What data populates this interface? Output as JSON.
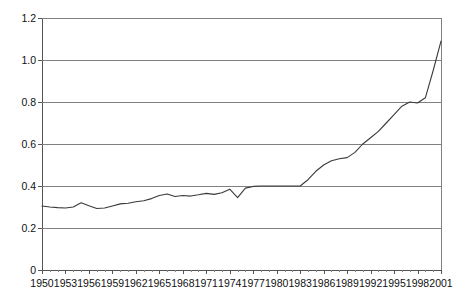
{
  "chart_data": {
    "type": "line",
    "title": "",
    "subtitle": "",
    "xlabel": "",
    "ylabel": "",
    "xlim": [
      1950,
      2001
    ],
    "ylim": [
      0,
      1.2
    ],
    "grid": true,
    "legend": false,
    "legend_position": "none",
    "y_ticks": [
      "0",
      "0.2",
      "0.4",
      "0.6",
      "0.8",
      "1.0",
      "1.2"
    ],
    "y_tick_values": [
      0,
      0.2,
      0.4,
      0.6,
      0.8,
      1.0,
      1.2
    ],
    "x_ticks": [
      "1950",
      "1953",
      "1956",
      "1959",
      "1962",
      "1965",
      "1968",
      "1971",
      "1974",
      "1977",
      "1980",
      "1983",
      "1986",
      "1989",
      "1992",
      "1995",
      "1998",
      "2001"
    ],
    "x_tick_values": [
      1950,
      1953,
      1956,
      1959,
      1962,
      1965,
      1968,
      1971,
      1974,
      1977,
      1980,
      1983,
      1986,
      1989,
      1992,
      1995,
      1998,
      2001
    ],
    "x": [
      1950,
      1951,
      1952,
      1953,
      1954,
      1955,
      1956,
      1957,
      1958,
      1959,
      1960,
      1961,
      1962,
      1963,
      1964,
      1965,
      1966,
      1967,
      1968,
      1969,
      1970,
      1971,
      1972,
      1973,
      1974,
      1975,
      1976,
      1977,
      1978,
      1979,
      1980,
      1981,
      1982,
      1983,
      1984,
      1985,
      1986,
      1987,
      1988,
      1989,
      1990,
      1991,
      1992,
      1993,
      1994,
      1995,
      1996,
      1997,
      1998,
      1999,
      2000,
      2001
    ],
    "values": [
      0.305,
      0.3,
      0.297,
      0.295,
      0.3,
      0.32,
      0.306,
      0.293,
      0.295,
      0.305,
      0.315,
      0.318,
      0.325,
      0.33,
      0.34,
      0.355,
      0.362,
      0.35,
      0.355,
      0.352,
      0.358,
      0.365,
      0.36,
      0.368,
      0.385,
      0.345,
      0.39,
      0.398,
      0.4,
      0.4,
      0.4,
      0.4,
      0.4,
      0.4,
      0.43,
      0.47,
      0.5,
      0.52,
      0.53,
      0.535,
      0.56,
      0.6,
      0.63,
      0.66,
      0.7,
      0.74,
      0.78,
      0.8,
      0.795,
      0.82,
      0.95,
      1.09
    ],
    "series": [
      {
        "name": "series-1",
        "color": "#3a3a3a",
        "values": [
          0.305,
          0.3,
          0.297,
          0.295,
          0.3,
          0.32,
          0.306,
          0.293,
          0.295,
          0.305,
          0.315,
          0.318,
          0.325,
          0.33,
          0.34,
          0.355,
          0.362,
          0.35,
          0.355,
          0.352,
          0.358,
          0.365,
          0.36,
          0.368,
          0.385,
          0.345,
          0.39,
          0.398,
          0.4,
          0.4,
          0.4,
          0.4,
          0.4,
          0.4,
          0.43,
          0.47,
          0.5,
          0.52,
          0.53,
          0.535,
          0.56,
          0.6,
          0.63,
          0.66,
          0.7,
          0.74,
          0.78,
          0.8,
          0.795,
          0.82,
          0.95,
          1.09
        ]
      }
    ],
    "colors": {
      "line": "#3a3a3a",
      "grid": "#808080",
      "axis": "#555555",
      "text": "#111111",
      "background": "#ffffff"
    }
  }
}
